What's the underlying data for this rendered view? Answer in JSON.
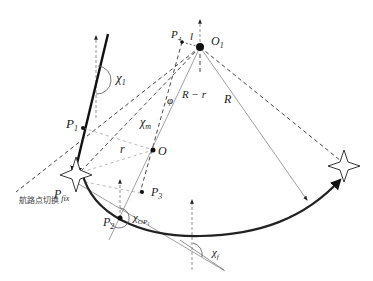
{
  "diagram": {
    "title": "",
    "labels": {
      "chi1": {
        "main": "χ",
        "sub": "1"
      },
      "chim": {
        "main": "χ",
        "sub": "m"
      },
      "chiOP2": {
        "main": "χ",
        "sub": "OP"
      },
      "chif": {
        "main": "χ",
        "sub": "f"
      },
      "P1": {
        "main": "P",
        "sub": "1"
      },
      "P2": {
        "main": "P",
        "sub": "2"
      },
      "P3": {
        "main": "P",
        "sub": "3"
      },
      "P4": {
        "main": "P",
        "sub": "4"
      },
      "Pfix": {
        "main": "P",
        "sub": "fix"
      },
      "O": "O",
      "O1": {
        "main": "O",
        "sub": "1"
      },
      "l": "l",
      "phi": "φ",
      "R_minus_r": "R − r",
      "R": "R",
      "r": "r",
      "waypoint_switch": "航路点切换"
    },
    "colors": {
      "stroke": "#222222",
      "thin": "#666666",
      "dashed": "#333333",
      "background": "#ffffff"
    }
  }
}
